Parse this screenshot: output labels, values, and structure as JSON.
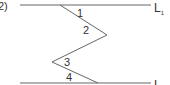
{
  "figure": {
    "item_label": "2)",
    "lines": [
      {
        "name": "L",
        "subscript": "1"
      },
      {
        "name": "L",
        "subscript": "2"
      }
    ],
    "angles": [
      "1",
      "2",
      "3",
      "4"
    ],
    "colors": {
      "stroke": "#666666",
      "text": "#333333"
    }
  }
}
